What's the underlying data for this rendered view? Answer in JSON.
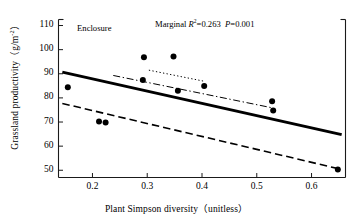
{
  "chart_data": {
    "type": "scatter",
    "title": "",
    "xlabel": "Plant Simpson diversity（unitless）",
    "ylabel_main": "Grassland productivity（g/m",
    "ylabel_sup": "-2",
    "ylabel_tail": "）",
    "xlim": [
      0.138,
      0.662
    ],
    "ylim": [
      47.0,
      112.5
    ],
    "grid": false,
    "legend": "none",
    "xticks": [
      0.2,
      0.3,
      0.4,
      0.5,
      0.6
    ],
    "xticklabels": [
      "0.2",
      "0.3",
      "0.4",
      "0.5",
      "0.6"
    ],
    "yticks": [
      50,
      60,
      70,
      80,
      90,
      100,
      110
    ],
    "yticklabels": [
      "50",
      "60",
      "70",
      "80",
      "90",
      "100",
      "110"
    ],
    "points": [
      {
        "x": 0.155,
        "y": 84.4
      },
      {
        "x": 0.212,
        "y": 70.2
      },
      {
        "x": 0.224,
        "y": 69.8
      },
      {
        "x": 0.294,
        "y": 96.8
      },
      {
        "x": 0.292,
        "y": 87.4
      },
      {
        "x": 0.348,
        "y": 97.2
      },
      {
        "x": 0.356,
        "y": 83.0
      },
      {
        "x": 0.404,
        "y": 84.9
      },
      {
        "x": 0.528,
        "y": 78.6
      },
      {
        "x": 0.53,
        "y": 74.8
      },
      {
        "x": 0.648,
        "y": 50.3
      }
    ],
    "series": [
      {
        "name": "marginal-fit",
        "style": "solid",
        "x": [
          0.145,
          0.655
        ],
        "y": [
          90.7,
          64.8
        ]
      },
      {
        "name": "dash-dot-fit",
        "style": "dashdot",
        "x": [
          0.238,
          0.53
        ],
        "y": [
          89.3,
          75.8
        ]
      },
      {
        "name": "dotted-fit",
        "style": "dotted",
        "x": [
          0.303,
          0.404
        ],
        "y": [
          91.5,
          86.9
        ]
      },
      {
        "name": "dashed-fit",
        "style": "dashed",
        "x": [
          0.145,
          0.652
        ],
        "y": [
          77.7,
          50.5
        ]
      }
    ],
    "annotations": [
      {
        "name": "enclosure-label",
        "text": "Enclosure",
        "x": 0.172,
        "y": 108.5
      }
    ],
    "stats": {
      "marginal_prefix": "Marginal ",
      "r_symbol": "R",
      "r_exponent": "2",
      "r_value": "=0.263",
      "p_symbol": "P",
      "p_value": "=0.001"
    }
  }
}
